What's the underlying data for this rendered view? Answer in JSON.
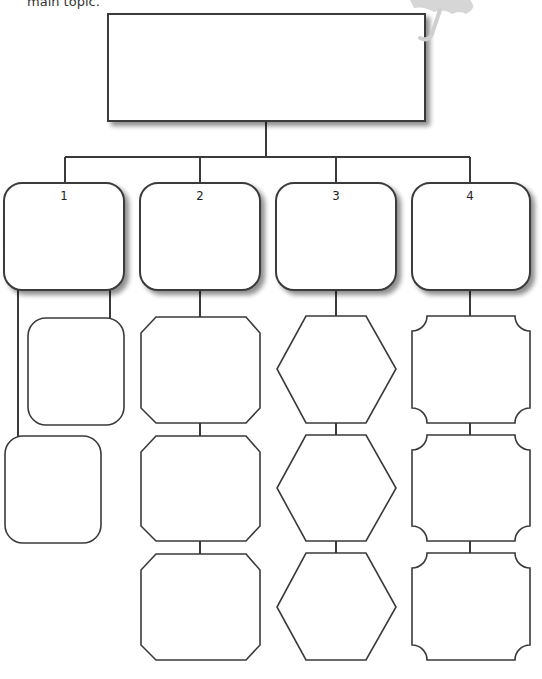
{
  "caption": "main topic.",
  "main_box": {
    "label": ""
  },
  "columns": [
    {
      "number": "1",
      "child_shape": "rounded-rect",
      "children": [
        "",
        ""
      ]
    },
    {
      "number": "2",
      "child_shape": "octagon",
      "children": [
        "",
        "",
        ""
      ]
    },
    {
      "number": "3",
      "child_shape": "hexagon",
      "children": [
        "",
        "",
        ""
      ]
    },
    {
      "number": "4",
      "child_shape": "scalloped-rect",
      "children": [
        "",
        "",
        ""
      ]
    }
  ],
  "decoration": {
    "icon": "umbrella-icon"
  },
  "colors": {
    "stroke": "#3a3a3a",
    "shadow": "#9a9a9a",
    "umbrella": "#cfcfcf"
  }
}
